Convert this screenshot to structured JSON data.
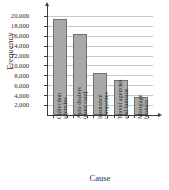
{
  "chart_data": {
    "type": "bar",
    "title": "",
    "xlabel": "Cause",
    "ylabel": "Frequency",
    "categories": [
      "Collection agencies",
      "Auto dealers (used cars)",
      "Insurance companies",
      "Travel agencies and bureaus",
      "Mortgage brokers"
    ],
    "category_lines": [
      [
        "Collection",
        "agencies"
      ],
      [
        "Auto dealers",
        "(used cars)"
      ],
      [
        "Insurance",
        "companies"
      ],
      [
        "Travel agencies",
        "and bureaus"
      ],
      [
        "Mortgage",
        "brokers"
      ]
    ],
    "values": [
      19300,
      16300,
      8400,
      7000,
      3700
    ],
    "ylim": [
      0,
      21000
    ],
    "yticks": [
      2000,
      4000,
      6000,
      8000,
      10000,
      12000,
      14000,
      16000,
      18000,
      20000
    ],
    "ytick_labels": [
      "2,000",
      "4,000",
      "6,000",
      "8,000",
      "10,000",
      "12,000",
      "14,000",
      "16,000",
      "18,000",
      "20,000"
    ],
    "grid": true,
    "legend": false,
    "bar_color": "#a9a9a9",
    "bar_edge_color": "#6e6e6e",
    "axis_color": "#3a3a3a",
    "grid_color": "#c9c9c9"
  }
}
